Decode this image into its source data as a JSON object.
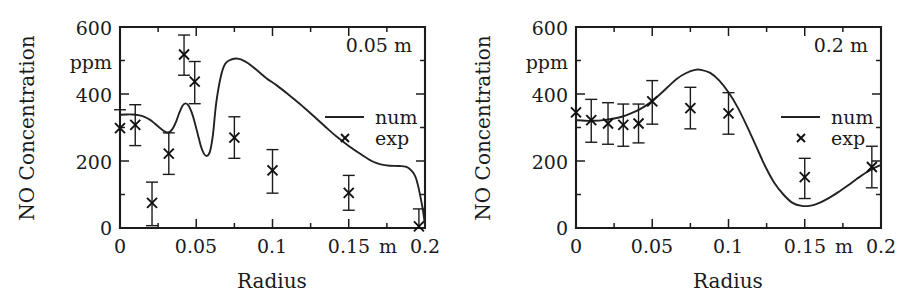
{
  "figure": {
    "panels": [
      {
        "id": "left",
        "annotation": "0.05 m",
        "axis": {
          "ylabel": "NO Concentration",
          "yunit": "ppm",
          "xlabel": "Radius",
          "xunit": "m",
          "yticks": [
            "0",
            "200",
            "400",
            "600"
          ],
          "xticks": [
            "0",
            "0.05",
            "0.1",
            "0.15",
            "0.2"
          ]
        },
        "legend": {
          "num_label": "num",
          "exp_label": "exp"
        }
      },
      {
        "id": "right",
        "annotation": "0.2 m",
        "axis": {
          "ylabel": "NO Concentration",
          "yunit": "ppm",
          "xlabel": "Radius",
          "xunit": "m",
          "yticks": [
            "0",
            "200",
            "400",
            "600"
          ],
          "xticks": [
            "0",
            "0.05",
            "0.1",
            "0.15",
            "0.2"
          ]
        },
        "legend": {
          "num_label": "num",
          "exp_label": "exp"
        }
      }
    ]
  },
  "chart_data": [
    {
      "type": "line",
      "id": "left",
      "title": "0.05 m",
      "xlabel": "Radius",
      "ylabel": "NO Concentration",
      "xunit": "m",
      "yunit": "ppm",
      "xlim": [
        0,
        0.2
      ],
      "ylim": [
        0,
        600
      ],
      "xticks": [
        0,
        0.05,
        0.1,
        0.15,
        0.2
      ],
      "yticks": [
        0,
        200,
        400,
        600
      ],
      "grid": false,
      "legend_position": "right-middle",
      "series": [
        {
          "name": "num",
          "type": "line",
          "x": [
            0.0,
            0.004,
            0.008,
            0.012,
            0.016,
            0.02,
            0.023,
            0.026,
            0.029,
            0.031,
            0.033,
            0.035,
            0.037,
            0.039,
            0.041,
            0.043,
            0.045,
            0.047,
            0.049,
            0.051,
            0.053,
            0.055,
            0.057,
            0.059,
            0.061,
            0.063,
            0.066,
            0.069,
            0.073,
            0.078,
            0.084,
            0.09,
            0.096,
            0.103,
            0.11,
            0.118,
            0.126,
            0.134,
            0.142,
            0.15,
            0.158,
            0.165,
            0.171,
            0.177,
            0.183,
            0.189,
            0.194,
            0.198,
            0.2
          ],
          "y": [
            338,
            339,
            339,
            337,
            332,
            322,
            311,
            299,
            289,
            285,
            288,
            300,
            320,
            345,
            365,
            372,
            365,
            345,
            315,
            280,
            245,
            222,
            215,
            228,
            280,
            370,
            450,
            490,
            503,
            505,
            492,
            470,
            447,
            425,
            400,
            370,
            338,
            305,
            273,
            245,
            220,
            200,
            190,
            186,
            185,
            180,
            150,
            70,
            8
          ]
        },
        {
          "name": "exp",
          "type": "scatter",
          "marker": "x",
          "x": [
            0.0,
            0.01,
            0.021,
            0.032,
            0.042,
            0.049,
            0.075,
            0.1,
            0.15,
            0.196
          ],
          "y": [
            298,
            308,
            75,
            222,
            518,
            437,
            270,
            172,
            105,
            5
          ],
          "yerr_lower": [
            0,
            62,
            68,
            62,
            62,
            66,
            62,
            68,
            52,
            0
          ],
          "yerr_upper": [
            55,
            60,
            62,
            62,
            58,
            60,
            62,
            62,
            52,
            52
          ]
        }
      ]
    },
    {
      "type": "line",
      "id": "right",
      "title": "0.2 m",
      "xlabel": "Radius",
      "ylabel": "NO Concentration",
      "xunit": "m",
      "yunit": "ppm",
      "xlim": [
        0,
        0.2
      ],
      "ylim": [
        0,
        600
      ],
      "xticks": [
        0,
        0.05,
        0.1,
        0.15,
        0.2
      ],
      "yticks": [
        0,
        200,
        400,
        600
      ],
      "grid": false,
      "legend_position": "right-middle",
      "series": [
        {
          "name": "num",
          "type": "line",
          "x": [
            0.0,
            0.006,
            0.012,
            0.018,
            0.024,
            0.03,
            0.036,
            0.042,
            0.048,
            0.054,
            0.06,
            0.066,
            0.072,
            0.078,
            0.082,
            0.088,
            0.094,
            0.1,
            0.106,
            0.112,
            0.118,
            0.124,
            0.13,
            0.136,
            0.142,
            0.148,
            0.154,
            0.16,
            0.166,
            0.172,
            0.178,
            0.184,
            0.19,
            0.196,
            0.2
          ],
          "y": [
            322,
            320,
            320,
            322,
            326,
            332,
            342,
            355,
            372,
            395,
            420,
            445,
            462,
            472,
            472,
            463,
            440,
            405,
            360,
            305,
            245,
            185,
            135,
            100,
            75,
            66,
            67,
            76,
            90,
            107,
            126,
            146,
            165,
            180,
            188
          ]
        },
        {
          "name": "exp",
          "type": "scatter",
          "marker": "x",
          "x": [
            0.0,
            0.01,
            0.021,
            0.031,
            0.041,
            0.05,
            0.075,
            0.1,
            0.15,
            0.194
          ],
          "y": [
            345,
            322,
            312,
            308,
            312,
            378,
            358,
            342,
            152,
            182
          ],
          "yerr_lower": [
            0,
            66,
            62,
            64,
            58,
            68,
            62,
            62,
            64,
            62
          ],
          "yerr_upper": [
            0,
            62,
            62,
            62,
            58,
            62,
            62,
            62,
            56,
            62
          ]
        }
      ]
    }
  ]
}
